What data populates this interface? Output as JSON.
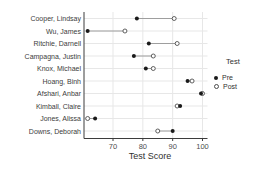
{
  "chart_data": {
    "type": "scatter",
    "subtype": "dumbbell-dot-plot",
    "title": "",
    "xlabel": "Test Score",
    "ylabel": "",
    "legend_title": "Test",
    "legend_position": "right",
    "grid": true,
    "x_ticks": [
      70,
      80,
      90,
      100
    ],
    "xlim": [
      60,
      102
    ],
    "categories": [
      "Cooper, Lindsay",
      "Wu, James",
      "Ritchie, Darnell",
      "Campagna, Justin",
      "Knox, Michael",
      "Hoang, Binh",
      "Afshari, Anbar",
      "Kimball, Claire",
      "Jones, Alissa",
      "Downs, Deborah"
    ],
    "series": [
      {
        "name": "Pre",
        "marker": "filled-dot",
        "values": [
          78,
          61.5,
          82,
          77,
          81,
          95,
          99.5,
          92.5,
          64,
          90
        ]
      },
      {
        "name": "Post",
        "marker": "open-dot",
        "values": [
          90.5,
          74,
          91.5,
          83.5,
          83.5,
          96.5,
          100,
          91.5,
          61.5,
          85
        ]
      }
    ],
    "colors": {
      "pre_fill": "#1a1a1a",
      "post_stroke": "#4d4d4d",
      "connector": "#8c8c8c",
      "gridline": "#e7e7e7",
      "axis": "#3c3c3c",
      "tick_text": "#4d4d4d",
      "label_text": "#3c3c3c"
    }
  }
}
